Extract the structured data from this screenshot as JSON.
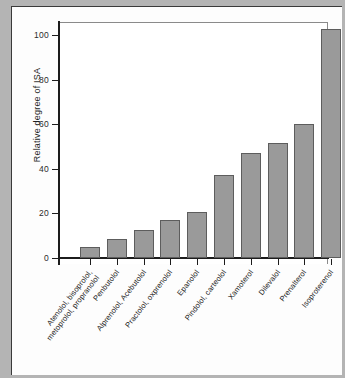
{
  "figure": {
    "y_axis_title": "Relative degree of ISA",
    "y_ticks": [
      "0",
      "20",
      "40",
      "60",
      "80",
      "100"
    ]
  },
  "chart_data": {
    "type": "bar",
    "title": "",
    "xlabel": "",
    "ylabel": "Relative degree of ISA",
    "ylim": [
      0,
      106
    ],
    "yticks": [
      0,
      20,
      40,
      60,
      80,
      100
    ],
    "grid": false,
    "legend": "none",
    "orientation": "vertical",
    "bar_color": "#9a9a9a",
    "bar_edge_color": "#5d5d5d",
    "categories": [
      "Atenolol, bisoprolol, metoprolol, propranolol",
      "Penbutolol",
      "Alprenolol, Acebutolol",
      "Practolol, oxprenolol",
      "Epanolol",
      "Pindolol, carteolol",
      "Xamoterol",
      "Dilevalol",
      "Prenalterol",
      "Isoproterenol"
    ],
    "category_lines": [
      [
        "Atenolol, bisoprolol,",
        "metoprolol, propranolol"
      ],
      [
        "Penbutolol",
        ""
      ],
      [
        "Alprenolol, Acebutolol",
        ""
      ],
      [
        "Practolol, oxprenolol",
        ""
      ],
      [
        "Epanolol",
        ""
      ],
      [
        "Pindolol, carteolol",
        ""
      ],
      [
        "Xamoterol",
        ""
      ],
      [
        "Dilevalol",
        ""
      ],
      [
        "Prenalterol",
        ""
      ],
      [
        "Isoproterenol",
        ""
      ]
    ],
    "values": [
      5,
      8.5,
      12.5,
      17,
      20.5,
      37.5,
      47,
      51.5,
      60,
      103
    ]
  }
}
